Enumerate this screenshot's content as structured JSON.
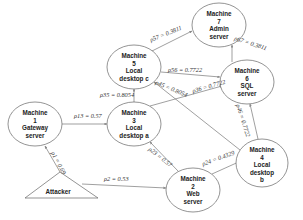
{
  "nodes": [
    {
      "id": "m7",
      "lines": [
        "Machine",
        "7",
        "Admin",
        "server"
      ],
      "cx": 219,
      "cy": 25,
      "rx": 27,
      "ry": 22
    },
    {
      "id": "m5",
      "lines": [
        "Machine",
        "5",
        "Local",
        "desktop c"
      ],
      "cx": 134,
      "cy": 67,
      "rx": 27,
      "ry": 22
    },
    {
      "id": "m6",
      "lines": [
        "Machine",
        "6",
        "SQL",
        "server"
      ],
      "cx": 247,
      "cy": 82,
      "rx": 27,
      "ry": 22
    },
    {
      "id": "m1",
      "lines": [
        "Machine",
        "1",
        "Gateway",
        "server"
      ],
      "cx": 35,
      "cy": 124,
      "rx": 27,
      "ry": 22
    },
    {
      "id": "m3",
      "lines": [
        "Machine",
        "3",
        "Local",
        "desktop a"
      ],
      "cx": 134,
      "cy": 124,
      "rx": 27,
      "ry": 22
    },
    {
      "id": "m4",
      "lines": [
        "Machine",
        "4",
        "Local",
        "desktop",
        "b"
      ],
      "cx": 262,
      "cy": 163,
      "rx": 26,
      "ry": 24
    },
    {
      "id": "m2",
      "lines": [
        "Machine",
        "2",
        "Web",
        "server"
      ],
      "cx": 193,
      "cy": 190,
      "rx": 27,
      "ry": 22
    }
  ],
  "attacker": {
    "label": "Attacker"
  },
  "edges": [
    {
      "id": "p57",
      "sub": "57",
      "value": "0.3811"
    },
    {
      "id": "p67",
      "sub": "67",
      "value": "0.3811"
    },
    {
      "id": "p56",
      "sub": "56",
      "value": "0.7722"
    },
    {
      "id": "p36",
      "sub": "36",
      "value": "0.7722"
    },
    {
      "id": "p46",
      "sub": "46",
      "value": "0.7722"
    },
    {
      "id": "p35",
      "sub": "35",
      "value": "0.8054"
    },
    {
      "id": "p45",
      "sub": "45",
      "value": "0.8054"
    },
    {
      "id": "p13",
      "sub": "13",
      "value": "0.57"
    },
    {
      "id": "p23",
      "sub": "23",
      "value": "0.57"
    },
    {
      "id": "p24",
      "sub": "24",
      "value": "0.4329"
    },
    {
      "id": "p1",
      "sub": "1",
      "value": "0.69"
    },
    {
      "id": "p2",
      "sub": "2",
      "value": "0.53"
    }
  ],
  "labels": {
    "p57": "ρ57 = 0.3811",
    "p67": "ρ67 = 0.3811",
    "p56": "ρ56 = 0.7722",
    "p36": "ρ36 = 0.7722",
    "p46": "ρ46 = 0.7722",
    "p35": "ρ35 = 0.8054",
    "p45": "ρ45 = 0.8054",
    "p13": "ρ13 = 0.57",
    "p23": "ρ23 = 0.57",
    "p24": "ρ24 = 0.4329",
    "p1": "ρ1 = 0.69",
    "p2": "ρ2 = 0.53"
  }
}
